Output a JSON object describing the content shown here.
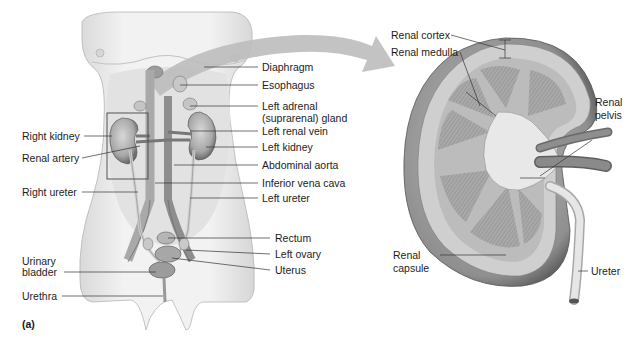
{
  "figure": {
    "panel_label": "(a)",
    "left_panel": {
      "title": "Female urinary system, anterior view",
      "labels_left": [
        {
          "id": "right-kidney",
          "text": "Right kidney"
        },
        {
          "id": "renal-artery",
          "text": "Renal artery"
        },
        {
          "id": "right-ureter",
          "text": "Right ureter"
        },
        {
          "id": "urinary-bladder",
          "text": "Urinary\nbladder",
          "line1": "Urinary",
          "line2": "bladder"
        },
        {
          "id": "urethra",
          "text": "Urethra"
        }
      ],
      "labels_right": [
        {
          "id": "diaphragm",
          "text": "Diaphragm"
        },
        {
          "id": "esophagus",
          "text": "Esophagus"
        },
        {
          "id": "left-adrenal-gland",
          "text": "Left adrenal (suprarenal) gland",
          "line1": "Left adrenal",
          "line2": "(suprarenal) gland"
        },
        {
          "id": "left-renal-vein",
          "text": "Left renal vein"
        },
        {
          "id": "left-kidney",
          "text": "Left kidney"
        },
        {
          "id": "abdominal-aorta",
          "text": "Abdominal aorta"
        },
        {
          "id": "inferior-vena-cava",
          "text": "Inferior vena cava"
        },
        {
          "id": "left-ureter",
          "text": "Left ureter"
        },
        {
          "id": "rectum",
          "text": "Rectum"
        },
        {
          "id": "left-ovary",
          "text": "Left ovary"
        },
        {
          "id": "uterus",
          "text": "Uterus"
        }
      ]
    },
    "right_panel": {
      "title": "Kidney, frontal section",
      "labels": [
        {
          "id": "renal-cortex",
          "text": "Renal cortex"
        },
        {
          "id": "renal-medulla",
          "text": "Renal medulla"
        },
        {
          "id": "renal-pelvis",
          "text": "Renal\npelvis",
          "line1": "Renal",
          "line2": "pelvis"
        },
        {
          "id": "renal-capsule",
          "text": "Renal\ncapsule",
          "line1": "Renal",
          "line2": "capsule"
        },
        {
          "id": "ureter",
          "text": "Ureter"
        }
      ]
    },
    "colors": {
      "body_fill": "#ececec",
      "arrow": "#bdbdbd",
      "organ": "#9a9a9a",
      "kidney_dark": "#6e6e6e",
      "leader_line": "#333333"
    }
  }
}
